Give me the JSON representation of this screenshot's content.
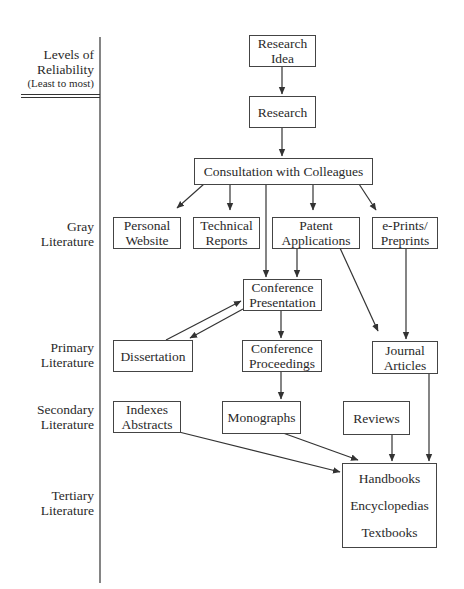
{
  "header": {
    "line1": "Levels of",
    "line2": "Reliability",
    "line3": "(Least to most)"
  },
  "levels": [
    {
      "id": "gray",
      "line1": "Gray",
      "line2": "Literature"
    },
    {
      "id": "primary",
      "line1": "Primary",
      "line2": "Literature"
    },
    {
      "id": "secondary",
      "line1": "Secondary",
      "line2": "Literature"
    },
    {
      "id": "tertiary",
      "line1": "Tertiary",
      "line2": "Literature"
    }
  ],
  "nodes": {
    "research_idea": {
      "line1": "Research",
      "line2": "Idea"
    },
    "research": {
      "line1": "Research"
    },
    "consultation": {
      "line1": "Consultation with Colleagues"
    },
    "personal_website": {
      "line1": "Personal",
      "line2": "Website"
    },
    "technical_reports": {
      "line1": "Technical",
      "line2": "Reports"
    },
    "patent_applications": {
      "line1": "Patent",
      "line2": "Applications"
    },
    "eprints": {
      "line1": "e-Prints/",
      "line2": "Preprints"
    },
    "conference_presentation": {
      "line1": "Conference",
      "line2": "Presentation"
    },
    "dissertation": {
      "line1": "Dissertation"
    },
    "conference_proceedings": {
      "line1": "Conference",
      "line2": "Proceedings"
    },
    "journal_articles": {
      "line1": "Journal",
      "line2": "Articles"
    },
    "indexes_abstracts": {
      "line1": "Indexes",
      "line2": "Abstracts"
    },
    "monographs": {
      "line1": "Monographs"
    },
    "reviews": {
      "line1": "Reviews"
    },
    "tertiary_works": {
      "line1": "Handbooks",
      "line2": "Encyclopedias",
      "line3": "Textbooks"
    }
  },
  "edges": [
    [
      "research_idea",
      "research"
    ],
    [
      "research",
      "consultation"
    ],
    [
      "consultation",
      "personal_website"
    ],
    [
      "consultation",
      "technical_reports"
    ],
    [
      "consultation",
      "patent_applications"
    ],
    [
      "consultation",
      "eprints"
    ],
    [
      "consultation",
      "conference_presentation"
    ],
    [
      "patent_applications",
      "conference_presentation"
    ],
    [
      "patent_applications",
      "journal_articles"
    ],
    [
      "eprints",
      "journal_articles"
    ],
    [
      "conference_presentation",
      "dissertation"
    ],
    [
      "dissertation",
      "conference_presentation"
    ],
    [
      "conference_presentation",
      "conference_proceedings"
    ],
    [
      "conference_proceedings",
      "monographs"
    ],
    [
      "indexes_abstracts",
      "tertiary_works"
    ],
    [
      "monographs",
      "tertiary_works"
    ],
    [
      "reviews",
      "tertiary_works"
    ],
    [
      "journal_articles",
      "tertiary_works"
    ]
  ],
  "colors": {
    "line": "#333333",
    "text": "#2a2a2a",
    "background": "#ffffff"
  }
}
